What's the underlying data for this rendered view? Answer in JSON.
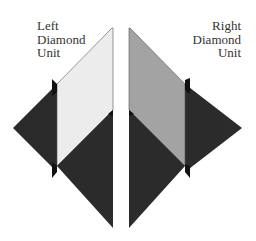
{
  "diagram": {
    "left_unit": {
      "label_lines": [
        "Left",
        "Diamond",
        "Unit"
      ],
      "fill_color": "#ececec"
    },
    "right_unit": {
      "label_lines": [
        "Right",
        "Diamond",
        "Unit"
      ],
      "fill_color": "#a3a3a3"
    },
    "dark_color": "#2b2b2b",
    "notch_color": "#111111"
  }
}
